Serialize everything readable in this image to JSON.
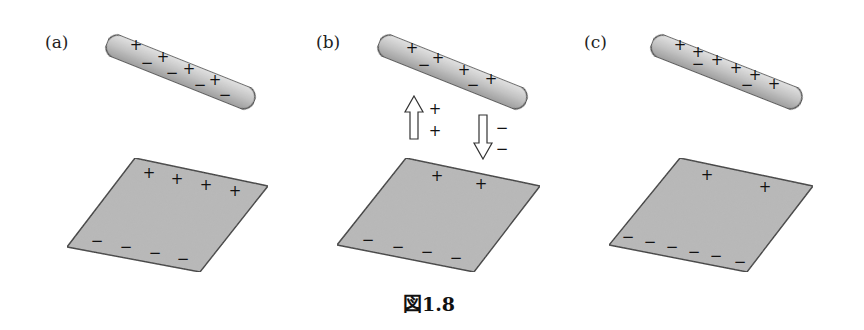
{
  "figure": {
    "caption": "図1.8",
    "colors": {
      "rod_fill_light": "#e4e4e4",
      "rod_fill_dark": "#9a9a9a",
      "plate_fill": "#b8b8b8",
      "stroke": "#333333",
      "text": "#111111"
    },
    "panels": [
      {
        "label": "(a)",
        "label_pos": [
          45,
          48
        ],
        "rod": {
          "x1": 118,
          "y1": 47,
          "x2": 243,
          "y2": 97,
          "thickness": 24,
          "plus": [
            [
              136,
              45
            ],
            [
              163,
              57
            ],
            [
              189,
              69
            ],
            [
              215,
              80
            ]
          ],
          "minus": [
            [
              147,
              63
            ],
            [
              172,
              73
            ],
            [
              200,
              85
            ],
            [
              225,
              95
            ]
          ]
        },
        "plate": {
          "points": [
            [
              135,
              158
            ],
            [
              268,
              186
            ],
            [
              200,
              272
            ],
            [
              67,
              247
            ]
          ],
          "plus": [
            [
              149,
              173
            ],
            [
              177,
              179
            ],
            [
              206,
              185
            ],
            [
              235,
              191
            ]
          ],
          "minus": [
            [
              97,
              241
            ],
            [
              126,
              247
            ],
            [
              155,
              253
            ],
            [
              183,
              259
            ]
          ]
        },
        "arrows": []
      },
      {
        "label": "(b)",
        "label_pos": [
          316,
          48
        ],
        "rod": {
          "x1": 390,
          "y1": 47,
          "x2": 515,
          "y2": 97,
          "thickness": 24,
          "plus": [
            [
              412,
              48
            ],
            [
              438,
              58
            ],
            [
              464,
              70
            ],
            [
              491,
              79
            ]
          ],
          "minus": [
            [
              424,
              65
            ],
            [
              473,
              85
            ]
          ]
        },
        "plate": {
          "points": [
            [
              406,
              158
            ],
            [
              540,
              186
            ],
            [
              474,
              272
            ],
            [
              337,
              245
            ]
          ],
          "plus": [
            [
              437,
              176
            ],
            [
              481,
              184
            ]
          ],
          "minus": [
            [
              368,
              240
            ],
            [
              398,
              247
            ],
            [
              427,
              252
            ],
            [
              456,
              258
            ]
          ]
        },
        "arrows": [
          {
            "direction": "up",
            "cx": 414,
            "top": 96,
            "bottom": 139,
            "signs": [
              "+",
              "+"
            ],
            "sign_x": 435,
            "sign_y": [
              109,
              131
            ]
          },
          {
            "direction": "down",
            "cx": 483,
            "top": 115,
            "bottom": 159,
            "signs": [
              "−",
              "−"
            ],
            "sign_x": 502,
            "sign_y": [
              128,
              149
            ]
          }
        ]
      },
      {
        "label": "(c)",
        "label_pos": [
          584,
          48
        ],
        "rod": {
          "x1": 663,
          "y1": 47,
          "x2": 790,
          "y2": 97,
          "thickness": 24,
          "plus": [
            [
              680,
              45
            ],
            [
              698,
              52
            ],
            [
              717,
              60
            ],
            [
              736,
              68
            ],
            [
              755,
              75
            ],
            [
              774,
              84
            ]
          ],
          "minus": [
            [
              698,
              64
            ],
            [
              747,
              85
            ]
          ]
        },
        "plate": {
          "points": [
            [
              680,
              158
            ],
            [
              813,
              186
            ],
            [
              747,
              272
            ],
            [
              609,
              245
            ]
          ],
          "plus": [
            [
              707,
              175
            ],
            [
              765,
              187
            ]
          ],
          "minus": [
            [
              628,
              237
            ],
            [
              650,
              242
            ],
            [
              672,
              247
            ],
            [
              694,
              252
            ],
            [
              716,
              256
            ],
            [
              740,
              262
            ]
          ]
        },
        "arrows": []
      }
    ]
  }
}
